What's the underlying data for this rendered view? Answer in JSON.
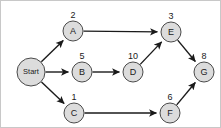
{
  "diagram": {
    "type": "directed-acyclic-graph",
    "background_color": "#ffffff",
    "node_fill_color": "#dcdcdc",
    "node_stroke_color": "#4a4a4a",
    "edge_color": "#1a1a1a",
    "border_color": "#c8c8c8",
    "nodes": [
      {
        "id": "start",
        "label": "Start",
        "weight": "",
        "cx": 30,
        "cy": 71,
        "r": 14,
        "small": true
      },
      {
        "id": "a",
        "label": "A",
        "weight": "2",
        "cx": 72,
        "cy": 30,
        "r": 10,
        "small": false
      },
      {
        "id": "b",
        "label": "B",
        "weight": "5",
        "cx": 81,
        "cy": 71,
        "r": 10,
        "small": false
      },
      {
        "id": "c",
        "label": "C",
        "weight": "1",
        "cx": 73,
        "cy": 112,
        "r": 10,
        "small": false
      },
      {
        "id": "d",
        "label": "D",
        "weight": "10",
        "cx": 132,
        "cy": 71,
        "r": 10,
        "small": false
      },
      {
        "id": "e",
        "label": "E",
        "weight": "3",
        "cx": 170,
        "cy": 31,
        "r": 10,
        "small": false
      },
      {
        "id": "f",
        "label": "F",
        "weight": "6",
        "cx": 169,
        "cy": 112,
        "r": 10,
        "small": false
      },
      {
        "id": "g",
        "label": "G",
        "weight": "8",
        "cx": 203,
        "cy": 71,
        "r": 10,
        "small": false
      }
    ],
    "edges": [
      {
        "id": "start-a",
        "from": "start",
        "to": "a"
      },
      {
        "id": "start-b",
        "from": "start",
        "to": "b"
      },
      {
        "id": "start-c",
        "from": "start",
        "to": "c"
      },
      {
        "id": "a-e",
        "from": "a",
        "to": "e"
      },
      {
        "id": "b-d",
        "from": "b",
        "to": "d"
      },
      {
        "id": "d-e",
        "from": "d",
        "to": "e"
      },
      {
        "id": "c-f",
        "from": "c",
        "to": "f"
      },
      {
        "id": "e-g",
        "from": "e",
        "to": "g"
      },
      {
        "id": "f-g",
        "from": "f",
        "to": "g"
      }
    ]
  }
}
